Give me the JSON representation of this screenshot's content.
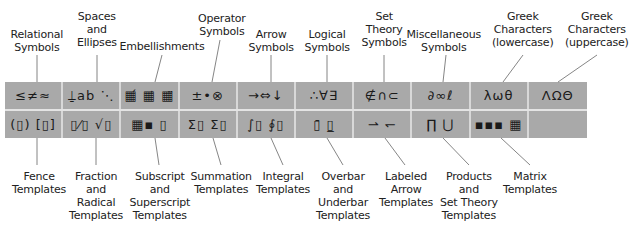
{
  "toolbar": {
    "top_row": [
      {
        "name": "relational-symbols",
        "glyphs": "≤≠≈"
      },
      {
        "name": "spaces-and-ellipses",
        "glyphs": "⍊ab ⋱"
      },
      {
        "name": "embellishments",
        "glyphs": "▦́ ▦̇ ▦̈"
      },
      {
        "name": "operator-symbols",
        "glyphs": "±•⊗"
      },
      {
        "name": "arrow-symbols",
        "glyphs": "→⇔↓"
      },
      {
        "name": "logical-symbols",
        "glyphs": "∴∀∃"
      },
      {
        "name": "set-theory-symbols",
        "glyphs": "∉∩⊂"
      },
      {
        "name": "miscellaneous-symbols",
        "glyphs": "∂∞ℓ"
      },
      {
        "name": "greek-lowercase",
        "glyphs": "λωθ"
      },
      {
        "name": "greek-uppercase",
        "glyphs": "ΛΩΘ"
      }
    ],
    "bottom_row": [
      {
        "name": "fence-templates",
        "glyphs": "(▯) [▯]"
      },
      {
        "name": "fraction-radical-templates",
        "glyphs": "▯⁄▯ √▯"
      },
      {
        "name": "subscript-superscript-templates",
        "glyphs": "▦▪ ▯"
      },
      {
        "name": "summation-templates",
        "glyphs": "Σ▯ Σ▯"
      },
      {
        "name": "integral-templates",
        "glyphs": "∫▯ ∮▯"
      },
      {
        "name": "overbar-underbar-templates",
        "glyphs": "▯̄ ▯̲"
      },
      {
        "name": "labeled-arrow-templates",
        "glyphs": "⇀ ↽"
      },
      {
        "name": "products-set-theory-templates",
        "glyphs": "∏ ⋃"
      },
      {
        "name": "matrix-templates",
        "glyphs": "▪▪▪ ▦"
      },
      {
        "name": "empty",
        "glyphs": ""
      }
    ]
  },
  "labels_top": [
    {
      "text": "Relational\nSymbols",
      "x": 37,
      "y": 28
    },
    {
      "text": "Spaces\nand\nEllipses",
      "x": 97,
      "y": 10
    },
    {
      "text": "Embellishments",
      "x": 162,
      "y": 40
    },
    {
      "text": "Operator\nSymbols",
      "x": 222,
      "y": 12
    },
    {
      "text": "Arrow\nSymbols",
      "x": 271,
      "y": 28
    },
    {
      "text": "Logical\nSymbols",
      "x": 327,
      "y": 28
    },
    {
      "text": "Set\nTheory\nSymbols",
      "x": 384,
      "y": 10
    },
    {
      "text": "Miscellaneous\nSymbols",
      "x": 444,
      "y": 28
    },
    {
      "text": "Greek\nCharacters\n(lowercase)",
      "x": 523,
      "y": 10
    },
    {
      "text": "Greek\nCharacters\n(uppercase)",
      "x": 597,
      "y": 10
    }
  ],
  "labels_bottom": [
    {
      "text": "Fence\nTemplates",
      "x": 39,
      "y": 170
    },
    {
      "text": "Fraction\nand\nRadical\nTemplates",
      "x": 96,
      "y": 170
    },
    {
      "text": "Subscript\nand\nSuperscript\nTemplates",
      "x": 160,
      "y": 170
    },
    {
      "text": "Summation\nTemplates",
      "x": 221,
      "y": 170
    },
    {
      "text": "Integral\nTemplates",
      "x": 283,
      "y": 170
    },
    {
      "text": "Overbar\nand\nUnderbar\nTemplates",
      "x": 343,
      "y": 170
    },
    {
      "text": "Labeled\nArrow\nTemplates",
      "x": 406,
      "y": 170
    },
    {
      "text": "Products\nand\nSet Theory\nTemplates",
      "x": 469,
      "y": 170
    },
    {
      "text": "Matrix\nTemplates",
      "x": 530,
      "y": 170
    }
  ]
}
